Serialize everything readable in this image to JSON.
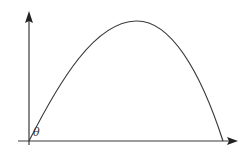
{
  "diagram": {
    "type": "projectile-trajectory",
    "angle_label": "θ",
    "axes": {
      "x_arrow": true,
      "y_arrow": true
    },
    "colors": {
      "stroke": "#3a3a3a",
      "background": "#ffffff"
    }
  }
}
